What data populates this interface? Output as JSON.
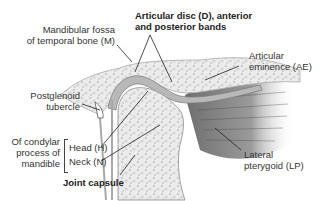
{
  "diagram": {
    "labels": {
      "mandibular_fossa_line1": "Mandibular fossa",
      "mandibular_fossa_line2": "of temporal bone (M)",
      "articular_disc_line1": "Articular disc (D), anterior",
      "articular_disc_line2": "and posterior bands",
      "articular_eminence_line1": "Articular",
      "articular_eminence_line2": "eminence (AE)",
      "postglenoid_line1": "Postglenoid",
      "postglenoid_line2": "tubercle",
      "condylar_line1": "Of condylar",
      "condylar_line2": "process of",
      "condylar_line3": "mandible",
      "head": "Head (H)",
      "neck": "Neck (N)",
      "joint_capsule": "Joint capsule",
      "lateral_pterygoid_line1": "Lateral",
      "lateral_pterygoid_line2": "pterygoid (LP)"
    },
    "colors": {
      "bone": "#eeeeee",
      "bone_outline": "#9a9a9a",
      "disc": "#b5b5b5",
      "muscle": "#6f6f6f",
      "leader": "#222222",
      "text": "#333333"
    }
  }
}
